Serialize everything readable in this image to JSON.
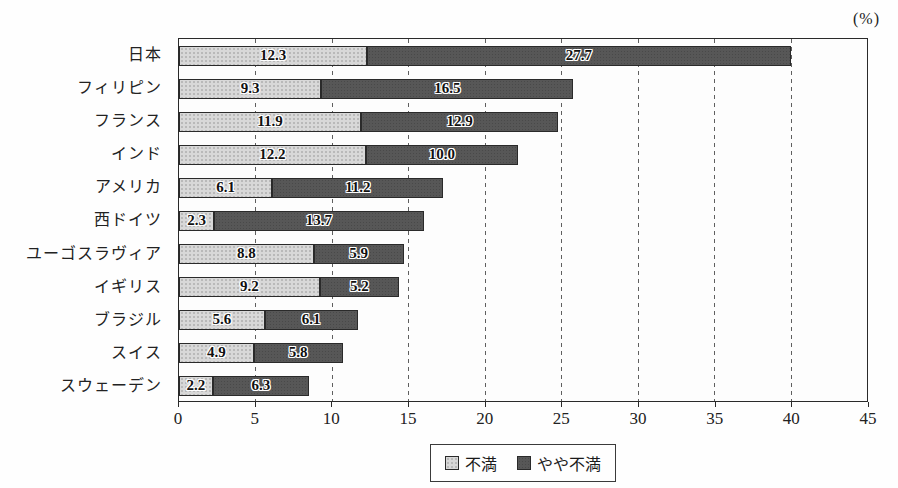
{
  "unit_label": "(%)",
  "chart_data": {
    "type": "bar",
    "orientation": "horizontal",
    "stacked": true,
    "title": "",
    "xlabel": "",
    "unit": "%",
    "categories": [
      "日本",
      "フィリピン",
      "フランス",
      "インド",
      "アメリカ",
      "西ドイツ",
      "ユーゴスラヴィア",
      "イギリス",
      "ブラジル",
      "スイス",
      "スウェーデン"
    ],
    "series": [
      {
        "name": "不満",
        "color": "#d8d8d8",
        "values": [
          12.3,
          9.3,
          11.9,
          12.2,
          6.1,
          2.3,
          8.8,
          9.2,
          5.6,
          4.9,
          2.2
        ]
      },
      {
        "name": "やや不満",
        "color": "#575757",
        "values": [
          27.7,
          16.5,
          12.9,
          10.0,
          11.2,
          13.7,
          5.9,
          5.2,
          6.1,
          5.8,
          6.3
        ]
      }
    ],
    "totals": [
      40.0,
      25.8,
      24.8,
      22.2,
      17.3,
      16.0,
      14.7,
      14.4,
      11.7,
      10.7,
      8.5
    ],
    "xlim": [
      0,
      45
    ],
    "x_ticks": [
      0,
      5,
      10,
      15,
      20,
      25,
      30,
      35,
      40,
      45
    ],
    "grid": true,
    "gridline_style": "dashed",
    "legend_position": "bottom",
    "value_label_decimals": 1
  }
}
